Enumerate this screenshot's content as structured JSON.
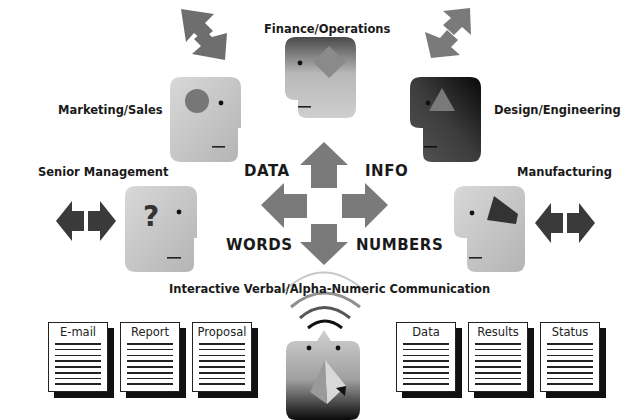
{
  "departments": {
    "finance": {
      "label": "Finance/Operations"
    },
    "marketing": {
      "label": "Marketing/Sales"
    },
    "design": {
      "label": "Design/Engineering"
    },
    "senior": {
      "label": "Senior Management"
    },
    "manufacturing": {
      "label": "Manufacturing"
    }
  },
  "center_arrows": {
    "data": "DATA",
    "info": "INFO",
    "words": "WORDS",
    "numbers": "NUMBERS"
  },
  "caption": "Interactive Verbal/Alpha-Numeric Communication",
  "documents": {
    "left": [
      {
        "title": "E-mail"
      },
      {
        "title": "Report"
      },
      {
        "title": "Proposal"
      }
    ],
    "right": [
      {
        "title": "Data"
      },
      {
        "title": "Results"
      },
      {
        "title": "Status"
      }
    ]
  },
  "colors": {
    "arrow_gray": "#7a7a7a",
    "arrow_dark": "#333333",
    "head_light": "#c4c4c4",
    "head_dark": "#3a3a3a",
    "text": "#1a1a1a"
  }
}
